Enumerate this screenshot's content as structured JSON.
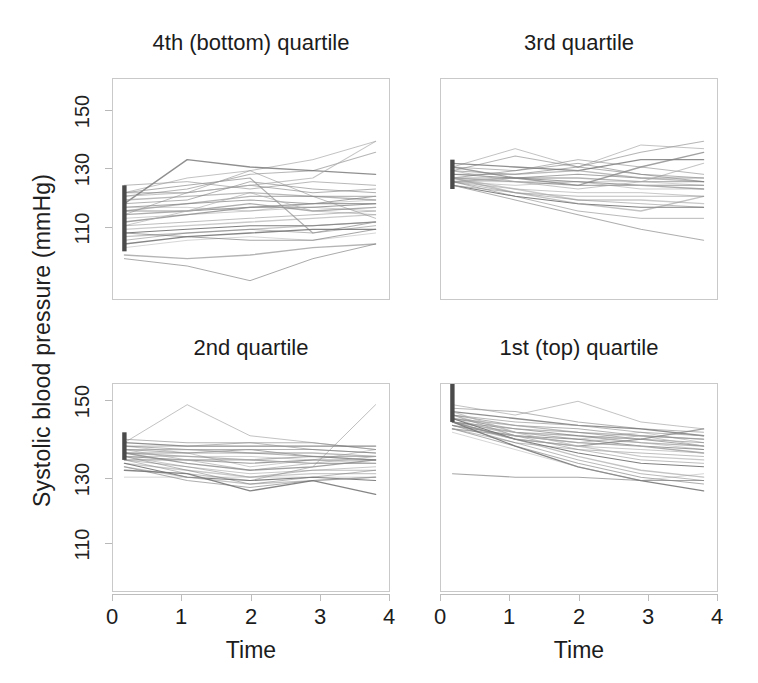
{
  "figure": {
    "ylabel": "Systolic blood pressure (mmHg)",
    "xlabel_left": "Time",
    "xlabel_right": "Time"
  },
  "chart_data": {
    "type": "line",
    "title": "",
    "xlabel": "Time",
    "ylabel": "Systolic blood pressure (mmHg)",
    "x": [
      0,
      1,
      2,
      3,
      4
    ],
    "xlim": [
      -0.15,
      4.15
    ],
    "ylim": [
      98,
      158
    ],
    "xticks": [
      0,
      1,
      2,
      3,
      4
    ],
    "xticklabels": [
      "0",
      "1",
      "2",
      "3",
      "4"
    ],
    "yticks": [
      110,
      130,
      150
    ],
    "yticklabels": [
      "110",
      "130",
      "150"
    ],
    "grid": false,
    "legend": null,
    "panel_layout": "2x2",
    "panels": [
      {
        "id": "q4",
        "position": "top-left",
        "title": "4th (bottom) quartile",
        "baseline_bar": {
          "low": 111,
          "high": 129
        },
        "series": [
          {
            "name": "s1",
            "values": [
              127,
              131,
              133,
              136,
              141
            ]
          },
          {
            "name": "s2",
            "values": [
              126,
              128,
              132,
              133,
              138
            ]
          },
          {
            "name": "s3",
            "values": [
              124,
              136,
              134,
              133,
              132
            ]
          },
          {
            "name": "s4",
            "values": [
              129,
              130,
              128,
              130,
              129
            ]
          },
          {
            "name": "s5",
            "values": [
              127,
              127,
              129,
              127,
              128
            ]
          },
          {
            "name": "s6",
            "values": [
              125,
              126,
              127,
              126,
              126
            ]
          },
          {
            "name": "s7",
            "values": [
              124,
              125,
              130,
              128,
              127
            ]
          },
          {
            "name": "s8",
            "values": [
              123,
              124,
              125,
              124,
              126
            ]
          },
          {
            "name": "s9",
            "values": [
              122,
              124,
              126,
              126,
              125
            ]
          },
          {
            "name": "s10",
            "values": [
              123,
              123,
              122,
              124,
              125
            ]
          },
          {
            "name": "s11",
            "values": [
              122,
              122,
              123,
              123,
              124
            ]
          },
          {
            "name": "s12",
            "values": [
              121,
              122,
              124,
              122,
              123
            ]
          },
          {
            "name": "s13",
            "values": [
              120,
              121,
              122,
              123,
              122
            ]
          },
          {
            "name": "s14",
            "values": [
              126,
              127,
              129,
              131,
              141
            ]
          },
          {
            "name": "s15",
            "values": [
              119,
              121,
              123,
              124,
              124
            ]
          },
          {
            "name": "s16",
            "values": [
              118,
              122,
              127,
              122,
              121
            ]
          },
          {
            "name": "s17",
            "values": [
              118,
              119,
              120,
              121,
              122
            ]
          },
          {
            "name": "s18",
            "values": [
              117,
              118,
              119,
              120,
              121
            ]
          },
          {
            "name": "s19",
            "values": [
              121,
              127,
              133,
              126,
              120
            ]
          },
          {
            "name": "s20",
            "values": [
              116,
              117,
              118,
              118,
              119
            ]
          },
          {
            "name": "s21",
            "values": [
              115,
              116,
              117,
              118,
              119
            ]
          },
          {
            "name": "s22",
            "values": [
              114,
              116,
              117,
              116,
              118
            ]
          },
          {
            "name": "s23",
            "values": [
              127,
              129,
              131,
              116,
              119
            ]
          },
          {
            "name": "s24",
            "values": [
              113,
              115,
              116,
              117,
              117
            ]
          },
          {
            "name": "s25",
            "values": [
              112,
              114,
              115,
              114,
              116
            ]
          },
          {
            "name": "s26",
            "values": [
              116,
              115,
              114,
              114,
              117
            ]
          },
          {
            "name": "s27",
            "values": [
              110,
              109,
              110,
              112,
              113
            ]
          },
          {
            "name": "s28",
            "values": [
              109,
              107,
              103,
              109,
              113
            ]
          }
        ]
      },
      {
        "id": "q3",
        "position": "top-right",
        "title": "3rd quartile",
        "baseline_bar": {
          "low": 128,
          "high": 136
        },
        "series": [
          {
            "name": "s1",
            "values": [
              134,
              139,
              134,
              140,
              139
            ]
          },
          {
            "name": "s2",
            "values": [
              133,
              137,
              134,
              138,
              141
            ]
          },
          {
            "name": "s3",
            "values": [
              135,
              134,
              133,
              136,
              136
            ]
          },
          {
            "name": "s4",
            "values": [
              134,
              133,
              136,
              134,
              132
            ]
          },
          {
            "name": "s5",
            "values": [
              133,
              132,
              134,
              132,
              131
            ]
          },
          {
            "name": "s6",
            "values": [
              132,
              132,
              133,
              131,
              130
            ]
          },
          {
            "name": "s7",
            "values": [
              131,
              133,
              135,
              132,
              130
            ]
          },
          {
            "name": "s8",
            "values": [
              131,
              131,
              132,
              131,
              131
            ]
          },
          {
            "name": "s9",
            "values": [
              130,
              131,
              131,
              130,
              130
            ]
          },
          {
            "name": "s10",
            "values": [
              130,
              130,
              130,
              130,
              129
            ]
          },
          {
            "name": "s11",
            "values": [
              132,
              131,
              130,
              129,
              129
            ]
          },
          {
            "name": "s12",
            "values": [
              131,
              130,
              129,
              129,
              128
            ]
          },
          {
            "name": "s13",
            "values": [
              130,
              129,
              130,
              128,
              128
            ]
          },
          {
            "name": "s14",
            "values": [
              133,
              130,
              128,
              130,
              135
            ]
          },
          {
            "name": "s15",
            "values": [
              134,
              131,
              129,
              134,
              138
            ]
          },
          {
            "name": "s16",
            "values": [
              130,
              128,
              127,
              127,
              126
            ]
          },
          {
            "name": "s17",
            "values": [
              129,
              127,
              126,
              126,
              126
            ]
          },
          {
            "name": "s18",
            "values": [
              131,
              128,
              125,
              125,
              124
            ]
          },
          {
            "name": "s19",
            "values": [
              130,
              127,
              125,
              124,
              123
            ]
          },
          {
            "name": "s20",
            "values": [
              129,
              126,
              124,
              123,
              123
            ]
          },
          {
            "name": "s21",
            "values": [
              131,
              127,
              124,
              122,
              126
            ]
          },
          {
            "name": "s22",
            "values": [
              130,
              126,
              122,
              120,
              120
            ]
          },
          {
            "name": "s23",
            "values": [
              129,
              125,
              121,
              117,
              114
            ]
          }
        ]
      },
      {
        "id": "q2",
        "position": "bottom-left",
        "title": "2nd quartile",
        "baseline_bar": {
          "low": 136,
          "high": 144
        },
        "series": [
          {
            "name": "s1",
            "values": [
              141,
              152,
              143,
              141,
              139
            ]
          },
          {
            "name": "s2",
            "values": [
              142,
              141,
              141,
              141,
              139
            ]
          },
          {
            "name": "s3",
            "values": [
              141,
              140,
              140,
              140,
              140
            ]
          },
          {
            "name": "s4",
            "values": [
              140,
              140,
              141,
              139,
              138
            ]
          },
          {
            "name": "s5",
            "values": [
              140,
              139,
              139,
              139,
              138
            ]
          },
          {
            "name": "s6",
            "values": [
              139,
              139,
              138,
              138,
              137
            ]
          },
          {
            "name": "s7",
            "values": [
              139,
              138,
              138,
              137,
              137
            ]
          },
          {
            "name": "s8",
            "values": [
              138,
              138,
              139,
              137,
              136
            ]
          },
          {
            "name": "s9",
            "values": [
              138,
              137,
              136,
              137,
              136
            ]
          },
          {
            "name": "s10",
            "values": [
              137,
              137,
              137,
              136,
              135
            ]
          },
          {
            "name": "s11",
            "values": [
              137,
              136,
              135,
              136,
              136
            ]
          },
          {
            "name": "s12",
            "values": [
              136,
              136,
              136,
              135,
              135
            ]
          },
          {
            "name": "s13",
            "values": [
              140,
              138,
              134,
              136,
              139
            ]
          },
          {
            "name": "s14",
            "values": [
              139,
              136,
              133,
              135,
              137
            ]
          },
          {
            "name": "s15",
            "values": [
              138,
              135,
              133,
              134,
              136
            ]
          },
          {
            "name": "s16",
            "values": [
              137,
              134,
              132,
              133,
              134
            ]
          },
          {
            "name": "s17",
            "values": [
              136,
              134,
              131,
              133,
              133
            ]
          },
          {
            "name": "s18",
            "values": [
              135,
              133,
              131,
              132,
              132
            ]
          },
          {
            "name": "s19",
            "values": [
              136,
              132,
              130,
              134,
              152
            ]
          },
          {
            "name": "s20",
            "values": [
              135,
              131,
              130,
              131,
              130
            ]
          },
          {
            "name": "s21",
            "values": [
              134,
              131,
              129,
              130,
              131
            ]
          },
          {
            "name": "s22",
            "values": [
              137,
              133,
              129,
              131,
              133
            ]
          },
          {
            "name": "s23",
            "values": [
              134,
              130,
              128,
              130,
              131
            ]
          },
          {
            "name": "s24",
            "values": [
              133,
              132,
              127,
              130,
              126
            ]
          },
          {
            "name": "s25",
            "values": [
              131,
              131,
              131,
              131,
              131
            ]
          }
        ]
      },
      {
        "id": "q1",
        "position": "bottom-right",
        "title": "1st (top) quartile",
        "baseline_bar": {
          "low": 147,
          "high": 158
        }
      }
    ],
    "panels_q1_series": [
      {
        "name": "s1",
        "values": [
          152,
          149,
          153,
          147,
          145
        ]
      },
      {
        "name": "s2",
        "values": [
          151,
          150,
          147,
          145,
          144
        ]
      },
      {
        "name": "s3",
        "values": [
          150,
          148,
          146,
          145,
          143
        ]
      },
      {
        "name": "s4",
        "values": [
          149,
          147,
          146,
          144,
          143
        ]
      },
      {
        "name": "s5",
        "values": [
          149,
          146,
          145,
          143,
          142
        ]
      },
      {
        "name": "s6",
        "values": [
          148,
          146,
          144,
          143,
          142
        ]
      },
      {
        "name": "s7",
        "values": [
          148,
          145,
          144,
          142,
          141
        ]
      },
      {
        "name": "s8",
        "values": [
          147,
          145,
          143,
          142,
          140
        ]
      },
      {
        "name": "s9",
        "values": [
          147,
          144,
          143,
          141,
          140
        ]
      },
      {
        "name": "s10",
        "values": [
          146,
          144,
          142,
          141,
          139
        ]
      },
      {
        "name": "s11",
        "values": [
          146,
          143,
          142,
          140,
          139
        ]
      },
      {
        "name": "s12",
        "values": [
          145,
          143,
          141,
          140,
          138
        ]
      },
      {
        "name": "s13",
        "values": [
          149,
          144,
          142,
          144,
          141
        ]
      },
      {
        "name": "s14",
        "values": [
          148,
          143,
          141,
          143,
          140
        ]
      },
      {
        "name": "s15",
        "values": [
          147,
          142,
          140,
          142,
          145
        ]
      },
      {
        "name": "s16",
        "values": [
          146,
          142,
          140,
          139,
          138
        ]
      },
      {
        "name": "s17",
        "values": [
          145,
          141,
          139,
          138,
          137
        ]
      },
      {
        "name": "s18",
        "values": [
          150,
          144,
          140,
          137,
          136
        ]
      },
      {
        "name": "s19",
        "values": [
          149,
          143,
          139,
          136,
          135
        ]
      },
      {
        "name": "s20",
        "values": [
          148,
          142,
          138,
          135,
          134
        ]
      },
      {
        "name": "s21",
        "values": [
          147,
          142,
          137,
          133,
          131
        ]
      },
      {
        "name": "s22",
        "values": [
          146,
          141,
          136,
          132,
          130
        ]
      },
      {
        "name": "s23",
        "values": [
          145,
          140,
          135,
          131,
          129
        ]
      },
      {
        "name": "s24",
        "values": [
          147,
          140,
          134,
          130,
          127
        ]
      },
      {
        "name": "s25",
        "values": [
          144,
          139,
          134,
          130,
          132
        ]
      },
      {
        "name": "s26",
        "values": [
          132,
          131,
          131,
          130,
          130
        ]
      }
    ]
  }
}
